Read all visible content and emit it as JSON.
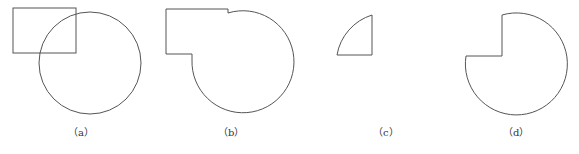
{
  "figure": {
    "panels": [
      {
        "id": "a",
        "label": "（a）",
        "description": "Rectangle overlapping a circle"
      },
      {
        "id": "b",
        "label": "（b）",
        "description": "Union of rectangle and circle"
      },
      {
        "id": "c",
        "label": "（c）",
        "description": "Intersection of rectangle and circle (quarter sector)"
      },
      {
        "id": "d",
        "label": "（d）",
        "description": "Circle minus rectangle (difference)"
      }
    ],
    "stroke_color": "#555555",
    "background": "#ffffff"
  }
}
